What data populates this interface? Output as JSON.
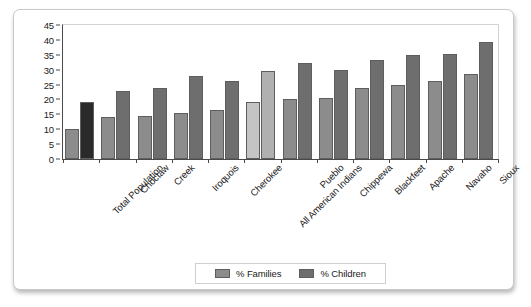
{
  "chart_data": {
    "type": "bar",
    "title": "",
    "xlabel": "",
    "ylabel": "",
    "ylim": [
      0,
      45
    ],
    "yticks": [
      0,
      5,
      10,
      15,
      20,
      25,
      30,
      35,
      40,
      45
    ],
    "grid": false,
    "legend_position": "bottom",
    "categories": [
      "Total Population",
      "Choctaw",
      "Creek",
      "Iroquois",
      "Cherokee",
      "All American Indians",
      "Pueblo",
      "Chippewa",
      "Blackfeet",
      "Apache",
      "Navaho",
      "Sioux"
    ],
    "series": [
      {
        "name": "% Families",
        "color": "#8c8c8c",
        "values": [
          10.0,
          14.0,
          14.5,
          15.5,
          16.3,
          19.0,
          20.3,
          20.6,
          24.0,
          25.0,
          26.3,
          28.4
        ]
      },
      {
        "name": "% Children",
        "color": "#6e6e6e",
        "values": [
          19.0,
          23.0,
          24.0,
          28.0,
          26.3,
          29.5,
          32.2,
          29.8,
          33.1,
          35.0,
          35.3,
          39.4
        ]
      }
    ],
    "highlight": {
      "first_group_children_color": "#2a2a2a",
      "all_american_indians_families_color": "#c4c4c4",
      "all_american_indians_children_color": "#b0b0b0"
    }
  },
  "legend": {
    "items": [
      {
        "label": "% Families",
        "swatch_color": "#8c8c8c"
      },
      {
        "label": "% Children",
        "swatch_color": "#6e6e6e"
      }
    ]
  }
}
